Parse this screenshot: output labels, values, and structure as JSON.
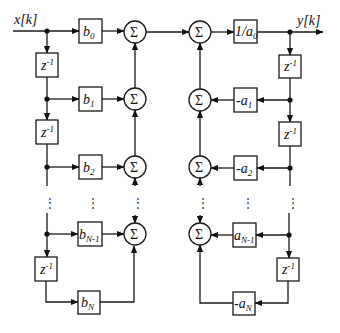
{
  "diagram": {
    "type": "Direct Form I IIR filter block diagram",
    "input_label": "x[k]",
    "output_label": "y[k]",
    "delay_label": "z",
    "delay_exponent": "-1",
    "sum_symbol": "Σ",
    "feedforward_coefficients": [
      {
        "base": "b",
        "sub": "0"
      },
      {
        "base": "b",
        "sub": "1"
      },
      {
        "base": "b",
        "sub": "2"
      },
      {
        "base": "b",
        "sub": "N-1"
      },
      {
        "base": "b",
        "sub": "N"
      }
    ],
    "normalization_gain": {
      "base": "1/a",
      "sub": "0"
    },
    "feedback_coefficients": [
      {
        "base": "-a",
        "sub": "1"
      },
      {
        "base": "-a",
        "sub": "2"
      },
      {
        "base": "a",
        "sub": "N-1"
      },
      {
        "base": "-a",
        "sub": "N"
      }
    ],
    "ellipsis": "⋮",
    "colors": {
      "stroke": "#1a1a1a",
      "background": "#ffffff"
    }
  }
}
